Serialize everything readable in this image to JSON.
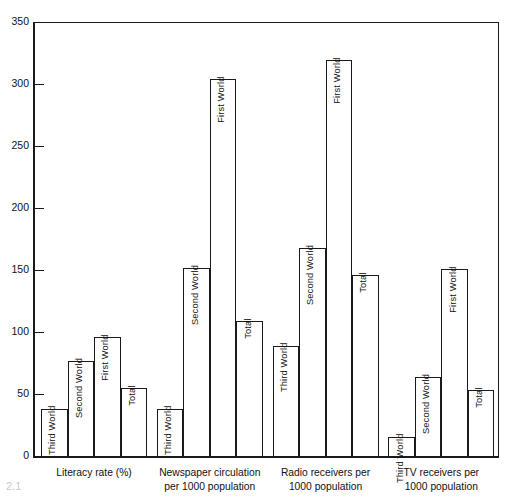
{
  "figure_number": "2.1",
  "chart_data": {
    "type": "bar",
    "title": "",
    "xlabel": "",
    "ylabel": "",
    "ylim": [
      0,
      350
    ],
    "yticks": [
      0,
      50,
      100,
      150,
      200,
      250,
      300,
      350
    ],
    "ytick_labels": [
      "0",
      "50",
      "100",
      "150",
      "200",
      "250",
      "300",
      "350"
    ],
    "grid": false,
    "legend": "none",
    "bar_style": "outline",
    "categories": [
      "Literacy rate  (%)",
      "Newspaper circulation\nper 1000 population",
      "Radio receivers per\n1000 population",
      "TV receivers per\n1000 population"
    ],
    "series_names": [
      "Third World",
      "Second World",
      "First World",
      "Total"
    ],
    "groups": [
      {
        "label": "Literacy rate  (%)",
        "bars": [
          {
            "name": "Third World",
            "value": 38
          },
          {
            "name": "Second World",
            "value": 77
          },
          {
            "name": "First World",
            "value": 96
          },
          {
            "name": "Total",
            "value": 55
          }
        ]
      },
      {
        "label": "Newspaper circulation\nper 1000 population",
        "bars": [
          {
            "name": "Third World",
            "value": 38
          },
          {
            "name": "Second World",
            "value": 152
          },
          {
            "name": "First World",
            "value": 304
          },
          {
            "name": "Total",
            "value": 109
          }
        ]
      },
      {
        "label": "Radio receivers per\n1000 population",
        "bars": [
          {
            "name": "Third World",
            "value": 89
          },
          {
            "name": "Second World",
            "value": 168
          },
          {
            "name": "First World",
            "value": 319
          },
          {
            "name": "Total",
            "value": 146
          }
        ]
      },
      {
        "label": "TV receivers per\n1000 population",
        "bars": [
          {
            "name": "Third World",
            "value": 15
          },
          {
            "name": "Second World",
            "value": 64
          },
          {
            "name": "First World",
            "value": 151
          },
          {
            "name": "Total",
            "value": 53
          }
        ]
      }
    ]
  }
}
